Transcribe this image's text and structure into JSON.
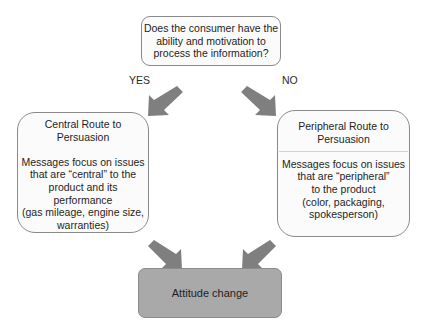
{
  "diagram": {
    "question": {
      "lines": [
        "Does the consumer have the",
        "ability and motivation to",
        "process the information?"
      ]
    },
    "yes_label": "YES",
    "no_label": "NO",
    "central": {
      "title_lines": [
        "Central Route to",
        "Persuasion"
      ],
      "body_lines": [
        "Messages focus on issues",
        "that are “central” to the",
        "product and its",
        "performance",
        "(gas mileage, engine size,",
        "warranties)"
      ]
    },
    "peripheral": {
      "title_lines": [
        "Peripheral Route to",
        "Persuasion"
      ],
      "body_lines": [
        "Messages focus on issues",
        "that are “peripheral”",
        "to the product",
        "(color, packaging,",
        "spokesperson)"
      ]
    },
    "outcome": "Attitude change",
    "colors": {
      "arrow": "#7f7f7f",
      "outcome_fill": "#a9a9a9",
      "box_border": "#8a8a8a"
    }
  }
}
